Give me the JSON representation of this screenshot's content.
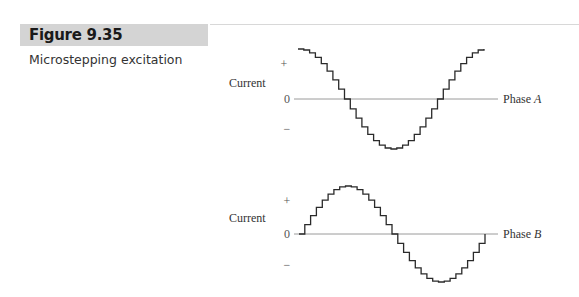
{
  "figure": {
    "number": "Figure 9.35",
    "caption": "Microstepping excitation"
  },
  "chart_data": [
    {
      "type": "line",
      "title": "Phase A",
      "ylabel": "Current",
      "y_ticks": [
        "+",
        "0",
        "−"
      ],
      "axis_label": "Phase A",
      "axis_label_main": "Phase ",
      "axis_label_italic": "A",
      "waveform": "cosine",
      "steps_per_period": 32,
      "periods": 1,
      "ylim": [
        -1,
        1
      ],
      "start_value": 1,
      "end_value": 1,
      "zero_crossings_fraction": [
        0.25,
        0.75
      ],
      "minimum_at_fraction": 0.5
    },
    {
      "type": "line",
      "title": "Phase B",
      "ylabel": "Current",
      "y_ticks": [
        "+",
        "0",
        "−"
      ],
      "axis_label": "Phase B",
      "axis_label_main": "Phase ",
      "axis_label_italic": "B",
      "waveform": "sine",
      "steps_per_period": 32,
      "periods": 1,
      "ylim": [
        -1,
        1
      ],
      "start_value": 0,
      "end_value": 0,
      "zero_crossings_fraction": [
        0,
        0.5,
        1
      ],
      "maximum_at_fraction": 0.25,
      "minimum_at_fraction": 0.75
    }
  ],
  "colors": {
    "trace": "#2a2a2a",
    "axis": "#9a9a9a",
    "banner": "#d4d4d4"
  }
}
